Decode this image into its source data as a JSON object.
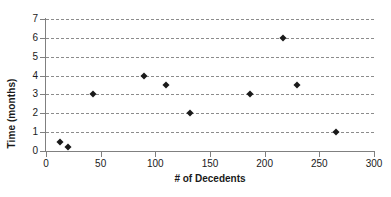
{
  "chart_data": {
    "type": "scatter",
    "title": "",
    "xlabel": "# of Decedents",
    "ylabel": "Time (months)",
    "xlim": [
      0,
      300
    ],
    "ylim": [
      0,
      7
    ],
    "xticks": [
      0,
      50,
      100,
      150,
      200,
      250,
      300
    ],
    "yticks": [
      0,
      1,
      2,
      3,
      4,
      5,
      6,
      7
    ],
    "xtick_labels": [
      "0",
      "50",
      "100",
      "150",
      "200",
      "250",
      "300"
    ],
    "ytick_labels": [
      "0",
      "1",
      "2",
      "3",
      "4",
      "5",
      "6",
      "7"
    ],
    "grid": {
      "horizontal": true,
      "vertical": false,
      "style": "dashed",
      "color": "#8c8c8c"
    },
    "legend": {
      "visible": false,
      "position": "none"
    },
    "marker": {
      "shape": "diamond",
      "color": "#1a1a1a",
      "size": 5
    },
    "series": [
      {
        "name": "decedents-vs-time",
        "points": [
          {
            "x": 13,
            "y": 0.5
          },
          {
            "x": 20,
            "y": 0.2
          },
          {
            "x": 43,
            "y": 3.0
          },
          {
            "x": 90,
            "y": 4.0
          },
          {
            "x": 110,
            "y": 3.5
          },
          {
            "x": 132,
            "y": 2.0
          },
          {
            "x": 187,
            "y": 3.0
          },
          {
            "x": 217,
            "y": 6.0
          },
          {
            "x": 230,
            "y": 3.5
          },
          {
            "x": 265,
            "y": 1.0
          }
        ]
      }
    ]
  }
}
